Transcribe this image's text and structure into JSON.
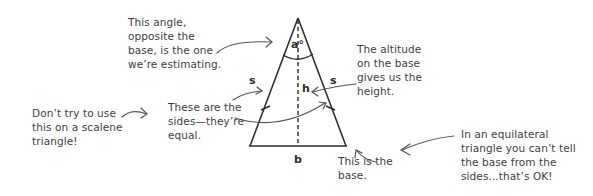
{
  "diagram": {
    "type": "annotated-isosceles-triangle",
    "labels": {
      "apex_angle": "a°",
      "side_left": "s",
      "side_right": "s",
      "altitude": "h",
      "base": "b"
    },
    "annotations": {
      "angle_note": "This angle,\nopposite the\nbase, is the one\nwe’re estimating.",
      "altitude_note": "The altitude\non the base\ngives us the\nheight.",
      "sides_note": "These are the\nsides—they’re\nequal.",
      "scalene_warning": "Don’t try to use\nthis on a scalene\ntriangle!",
      "base_note": "This is the\nbase.",
      "equilateral_note": "In an equilateral\ntriangle you can’t tell\nthe base from the\nsides...that’s OK!"
    },
    "colors": {
      "ink": "#2b2b2b",
      "annotation_text": "#3d3d3d",
      "arrow": "#555555",
      "background": "#ffffff"
    }
  }
}
